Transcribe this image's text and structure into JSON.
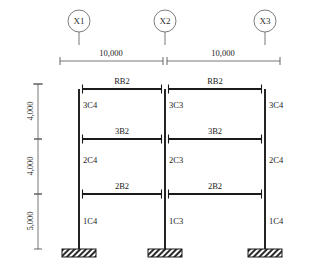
{
  "drawing": {
    "caption": "",
    "colors": {
      "line": "#1a1a1a",
      "thin": "#555555",
      "bubble_stroke": "#6e6e6e",
      "hatch": "#2b2b2b",
      "background": "#ffffff"
    }
  },
  "grid": {
    "bubbles": [
      {
        "label": "X1",
        "cx": 79,
        "cy": 21,
        "r": 11
      },
      {
        "label": "X2",
        "cx": 165,
        "cy": 21,
        "r": 11
      },
      {
        "label": "X3",
        "cx": 265,
        "cy": 21,
        "r": 11
      }
    ]
  },
  "dimensions": {
    "horizontal": [
      {
        "label": "10,000",
        "x1": 60,
        "x2": 163,
        "y": 61,
        "tx": 111,
        "ty": 56
      },
      {
        "label": "10,000",
        "x1": 167,
        "x2": 280,
        "y": 61,
        "tx": 223,
        "ty": 56
      }
    ],
    "vertical": [
      {
        "label": "4,000",
        "y1": 84,
        "y2": 139,
        "x": 38,
        "tx": 33,
        "ty": 111
      },
      {
        "label": "4,000",
        "y1": 139,
        "y2": 194,
        "x": 38,
        "tx": 33,
        "ty": 166
      },
      {
        "label": "5,000",
        "y1": 194,
        "y2": 249,
        "x": 38,
        "tx": 33,
        "ty": 221
      }
    ]
  },
  "frame": {
    "column_lines": [
      {
        "name": "X1",
        "x": 79
      },
      {
        "name": "X2",
        "x": 165
      },
      {
        "name": "X3",
        "x": 265
      }
    ],
    "levels": [
      {
        "name": "roof",
        "y": 89
      },
      {
        "name": "level3",
        "y": 139
      },
      {
        "name": "level2",
        "y": 194
      },
      {
        "name": "base",
        "y": 249
      }
    ],
    "beams": [
      {
        "label": "RB2",
        "level": "roof",
        "x1": 79,
        "x2": 165,
        "y": 89,
        "tx": 122,
        "ty": 84
      },
      {
        "label": "RB2",
        "level": "roof",
        "x1": 165,
        "x2": 265,
        "y": 89,
        "tx": 215,
        "ty": 84
      },
      {
        "label": "3B2",
        "level": "level3",
        "x1": 79,
        "x2": 165,
        "y": 139,
        "tx": 122,
        "ty": 134
      },
      {
        "label": "3B2",
        "level": "level3",
        "x1": 165,
        "x2": 265,
        "y": 139,
        "tx": 215,
        "ty": 134
      },
      {
        "label": "2B2",
        "level": "level2",
        "x1": 79,
        "x2": 165,
        "y": 194,
        "tx": 122,
        "ty": 189
      },
      {
        "label": "2B2",
        "level": "level2",
        "x1": 165,
        "x2": 265,
        "y": 194,
        "tx": 215,
        "ty": 189
      }
    ],
    "columns": [
      {
        "label": "3C4",
        "line": "X1",
        "x": 79,
        "y1": 89,
        "y2": 139,
        "tx": 83,
        "ty": 108
      },
      {
        "label": "2C4",
        "line": "X1",
        "x": 79,
        "y1": 139,
        "y2": 194,
        "tx": 83,
        "ty": 163
      },
      {
        "label": "1C4",
        "line": "X1",
        "x": 79,
        "y1": 194,
        "y2": 249,
        "tx": 83,
        "ty": 224
      },
      {
        "label": "3C3",
        "line": "X2",
        "x": 165,
        "y1": 89,
        "y2": 139,
        "tx": 169,
        "ty": 108
      },
      {
        "label": "2C3",
        "line": "X2",
        "x": 165,
        "y1": 139,
        "y2": 194,
        "tx": 169,
        "ty": 163
      },
      {
        "label": "1C3",
        "line": "X2",
        "x": 165,
        "y1": 194,
        "y2": 249,
        "tx": 169,
        "ty": 224
      },
      {
        "label": "3C4",
        "line": "X3",
        "x": 265,
        "y1": 89,
        "y2": 139,
        "tx": 269,
        "ty": 108
      },
      {
        "label": "2C4",
        "line": "X3",
        "x": 265,
        "y1": 139,
        "y2": 194,
        "tx": 269,
        "ty": 163
      },
      {
        "label": "1C4",
        "line": "X3",
        "x": 265,
        "y1": 194,
        "y2": 249,
        "tx": 269,
        "ty": 224
      }
    ],
    "supports": [
      {
        "line": "X1",
        "cx": 79,
        "y": 249,
        "w": 34,
        "h": 8,
        "type": "fixed-footing"
      },
      {
        "line": "X2",
        "cx": 165,
        "y": 249,
        "w": 34,
        "h": 8,
        "type": "fixed-footing"
      },
      {
        "line": "X3",
        "cx": 265,
        "y": 249,
        "w": 34,
        "h": 8,
        "type": "fixed-footing"
      }
    ]
  }
}
